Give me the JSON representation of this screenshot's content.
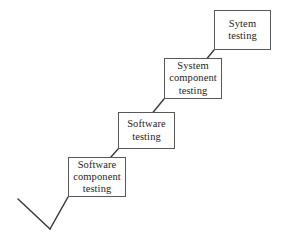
{
  "diagram": {
    "type": "flow-diagram",
    "background_color": "#ffffff",
    "line_color": "#3b3b3d",
    "box_border_color": "#58585a",
    "text_color": "#231f20",
    "boxes": [
      {
        "id": "software-component-testing",
        "label": "Software\ncomponent\ntesting",
        "line1": "Software",
        "line2": "component",
        "line3": "testing",
        "x": 68,
        "y": 157,
        "width": 58,
        "height": 40
      },
      {
        "id": "software-testing",
        "label": "Software\ntesting",
        "line1": "Software",
        "line2": "testing",
        "line3": "",
        "x": 118,
        "y": 112,
        "width": 57,
        "height": 37
      },
      {
        "id": "system-component-testing",
        "label": "System\ncomponent\ntesting",
        "line1": "System",
        "line2": "component",
        "line3": "testing",
        "x": 164,
        "y": 58,
        "width": 58,
        "height": 41
      },
      {
        "id": "sytem-testing",
        "label": "Sytem\ntesting",
        "line1": "Sytem",
        "line2": "testing",
        "line3": "",
        "x": 214,
        "y": 10,
        "width": 57,
        "height": 40
      }
    ],
    "connectors": [
      {
        "id": "connector-system-to-system-component",
        "from": "sytem-testing",
        "to": "system-component-testing",
        "x1": 214,
        "y1": 50,
        "x2": 200,
        "y2": 67
      },
      {
        "id": "connector-system-component-to-software",
        "from": "system-component-testing",
        "to": "software-testing",
        "x1": 164,
        "y1": 99,
        "x2": 150,
        "y2": 116
      },
      {
        "id": "connector-software-to-software-component",
        "from": "software-testing",
        "to": "software-component-testing",
        "x1": 118,
        "y1": 149,
        "x2": 104,
        "y2": 165
      },
      {
        "id": "connector-software-component-to-vertex",
        "from": "software-component-testing",
        "to": "v-vertex",
        "x1": 68,
        "y1": 197,
        "x2": 50,
        "y2": 229
      },
      {
        "id": "connector-v-left-arm",
        "from": "v-vertex",
        "to": "v-left-end",
        "x1": 50,
        "y1": 229,
        "x2": 18,
        "y2": 199
      }
    ]
  }
}
